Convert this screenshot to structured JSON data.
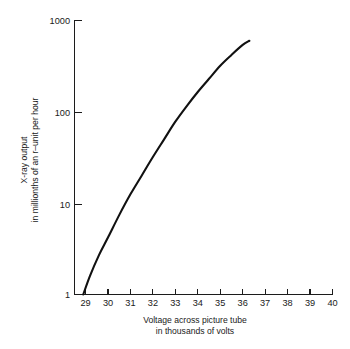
{
  "chart_data": {
    "type": "line",
    "title": "",
    "xlabel": "Voltage across picture tube in thousands of volts",
    "xlabel_line1": "Voltage across picture tube",
    "xlabel_line2": "in thousands of volts",
    "ylabel": "X-ray output in millionths of an r-unit per hour",
    "ylabel_line1": "X-ray output",
    "ylabel_line2": "in millionths of an r–unit per hour",
    "yscale": "log",
    "xscale": "linear",
    "xlim": [
      28.3,
      40
    ],
    "ylim": [
      1,
      1000
    ],
    "grid": false,
    "legend": false,
    "xticks": [
      29,
      30,
      31,
      32,
      33,
      34,
      35,
      36,
      37,
      38,
      39,
      40
    ],
    "xtick_labels": [
      "29",
      "30",
      "31",
      "32",
      "33",
      "34",
      "35",
      "36",
      "37",
      "38",
      "39",
      "40"
    ],
    "yticks": [
      1,
      10,
      100,
      1000
    ],
    "ytick_labels": [
      "1",
      "10",
      "100",
      "1000"
    ],
    "series": [
      {
        "name": "X-ray output",
        "x": [
          28.9,
          29.2,
          29.6,
          30.0,
          30.5,
          31.0,
          31.5,
          32.0,
          32.5,
          33.0,
          33.5,
          34.0,
          34.5,
          35.0,
          35.5,
          36.0,
          36.3
        ],
        "values": [
          1.0,
          1.6,
          2.7,
          4.2,
          7.4,
          12.5,
          20.0,
          32.0,
          50.0,
          78.0,
          115.0,
          165.0,
          230.0,
          320.0,
          420.0,
          540.0,
          600.0
        ]
      }
    ],
    "line_color": "#111111",
    "axis_color": "#1c1c1c",
    "background_color": "#ffffff"
  }
}
